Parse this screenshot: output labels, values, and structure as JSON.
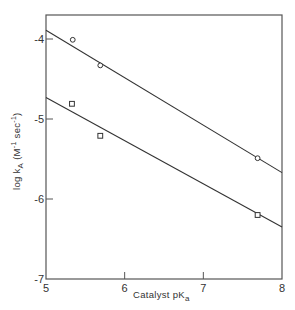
{
  "chart_data": {
    "type": "scatter",
    "title": "",
    "xlabel": "Catalyst pKa",
    "xlabel_main": "Catalyst pK",
    "xlabel_sub": "a",
    "ylabel": "log kA (M-1 sec-1)",
    "ylabel_main": "log k",
    "ylabel_sub": "A",
    "ylabel_units_open": " (M",
    "ylabel_units_exp1": "-1",
    "ylabel_units_mid": " sec",
    "ylabel_units_exp2": "-1",
    "ylabel_units_close": ")",
    "xlim": [
      5,
      8
    ],
    "ylim": [
      -7,
      -3.7
    ],
    "xticks": [
      "5",
      "6",
      "7",
      "8"
    ],
    "yticks": [
      "-4",
      "-5",
      "-6",
      "-7"
    ],
    "grid": false,
    "legend": null,
    "series": [
      {
        "name": "circles",
        "marker": "circle",
        "points": [
          {
            "x": 5.34,
            "y": -4.01
          },
          {
            "x": 5.69,
            "y": -4.33
          },
          {
            "x": 7.69,
            "y": -5.49
          }
        ],
        "fit_line": {
          "x": [
            5,
            8
          ],
          "y": [
            -3.89,
            -5.67
          ]
        }
      },
      {
        "name": "squares",
        "marker": "square",
        "points": [
          {
            "x": 5.33,
            "y": -4.81
          },
          {
            "x": 5.69,
            "y": -5.21
          },
          {
            "x": 7.69,
            "y": -6.2
          }
        ],
        "fit_line": {
          "x": [
            5,
            8
          ],
          "y": [
            -4.73,
            -6.35
          ]
        }
      }
    ]
  },
  "colors": {
    "ink": "#333333",
    "background": "#ffffff"
  }
}
